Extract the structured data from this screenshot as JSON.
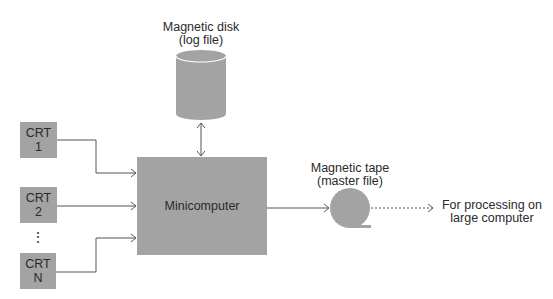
{
  "diagram": {
    "colors": {
      "fill": "#a3a3a3",
      "line": "#555555",
      "text": "#2a2a2a",
      "background": "#ffffff"
    },
    "nodes": {
      "crt1": {
        "line1": "CRT",
        "line2": "1"
      },
      "crt2": {
        "line1": "CRT",
        "line2": "2"
      },
      "ellipsis": "⋮",
      "crtn": {
        "line1": "CRT",
        "line2": "N"
      },
      "minicomputer": {
        "label": "Minicomputer"
      },
      "disk": {
        "line1": "Magnetic disk",
        "line2": "(log file)"
      },
      "tape": {
        "line1": "Magnetic tape",
        "line2": "(master file)"
      },
      "output": {
        "line1": "For processing on",
        "line2": "large computer"
      }
    },
    "edges": [
      {
        "from": "CRT 1",
        "to": "Minicomputer",
        "style": "solid"
      },
      {
        "from": "CRT 2",
        "to": "Minicomputer",
        "style": "solid"
      },
      {
        "from": "CRT N",
        "to": "Minicomputer",
        "style": "solid"
      },
      {
        "from": "Minicomputer",
        "to": "Magnetic disk",
        "style": "solid-bidirectional"
      },
      {
        "from": "Minicomputer",
        "to": "Magnetic tape",
        "style": "solid"
      },
      {
        "from": "Magnetic tape",
        "to": "For processing on large computer",
        "style": "dashed"
      }
    ]
  }
}
